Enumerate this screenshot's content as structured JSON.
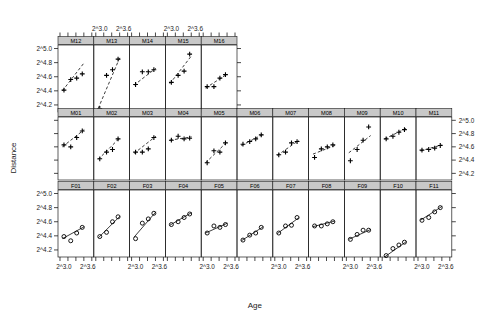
{
  "figure": {
    "xlabel": "Age",
    "ylabel": "Distance",
    "y_ticks": [
      "2^5.0",
      "2^4.8",
      "2^4.6",
      "2^4.4",
      "2^4.2"
    ],
    "x_ticks": [
      "2^3.0",
      "2^3.6"
    ],
    "strip_fill": "#c8c8c8",
    "line_color": "#1a1a1a",
    "marker_color": "#000000"
  },
  "chart_data": {
    "type": "scatter",
    "title": "",
    "xlabel": "Age",
    "ylabel": "Distance",
    "xlim": [
      2.85,
      3.75
    ],
    "ylim": [
      4.1,
      5.05
    ],
    "xtick_values": [
      3.0,
      3.6
    ],
    "xtick_labels": [
      "2^3.0",
      "2^3.6"
    ],
    "ytick_values": [
      5.0,
      4.8,
      4.6,
      4.4,
      4.2
    ],
    "ytick_labels": [
      "2^5.0",
      "2^4.8",
      "2^4.6",
      "2^4.4",
      "2^4.2"
    ],
    "grid": false,
    "legend": "none",
    "x_values": [
      3.0,
      3.17,
      3.32,
      3.46
    ],
    "rows": [
      {
        "row": "top",
        "marker": "plus",
        "linestyle": "dashed",
        "panels": [
          {
            "label": "M12",
            "values": [
              4.41,
              4.56,
              4.58,
              4.64
            ],
            "fit": [
              4.4,
              4.8
            ]
          },
          {
            "label": "M13",
            "values": [
              4.15,
              4.62,
              4.7,
              4.85
            ],
            "fit": [
              4.15,
              4.88
            ]
          },
          {
            "label": "M14",
            "values": [
              4.49,
              4.67,
              4.67,
              4.7
            ],
            "fit": [
              4.48,
              4.72
            ]
          },
          {
            "label": "M15",
            "values": [
              4.52,
              4.62,
              4.68,
              4.92
            ],
            "fit": [
              4.5,
              4.9
            ]
          },
          {
            "label": "M16",
            "values": [
              4.46,
              4.46,
              4.58,
              4.63
            ],
            "fit": [
              4.44,
              4.64
            ]
          }
        ]
      },
      {
        "row": "middle",
        "marker": "plus",
        "linestyle": "dashed",
        "panels": [
          {
            "label": "M01",
            "values": [
              4.63,
              4.6,
              4.74,
              4.84
            ],
            "fit": [
              4.6,
              4.86
            ]
          },
          {
            "label": "M02",
            "values": [
              4.42,
              4.52,
              4.56,
              4.72
            ],
            "fit": [
              4.41,
              4.74
            ]
          },
          {
            "label": "M03",
            "values": [
              4.52,
              4.52,
              4.57,
              4.74
            ],
            "fit": [
              4.5,
              4.76
            ]
          },
          {
            "label": "M04",
            "values": [
              4.7,
              4.76,
              4.72,
              4.73
            ],
            "fit": [
              4.7,
              4.75
            ]
          },
          {
            "label": "M05",
            "values": [
              4.36,
              4.54,
              4.52,
              4.66
            ],
            "fit": [
              4.36,
              4.68
            ]
          },
          {
            "label": "M06",
            "values": [
              4.64,
              4.68,
              4.72,
              4.78
            ],
            "fit": [
              4.62,
              4.79
            ]
          },
          {
            "label": "M07",
            "values": [
              4.48,
              4.52,
              4.66,
              4.68
            ],
            "fit": [
              4.47,
              4.7
            ]
          },
          {
            "label": "M08",
            "values": [
              4.44,
              4.57,
              4.6,
              4.63
            ],
            "fit": [
              4.49,
              4.62
            ]
          },
          {
            "label": "M09",
            "values": [
              4.39,
              4.56,
              4.7,
              4.9
            ],
            "fit": [
              4.51,
              4.77
            ]
          },
          {
            "label": "M10",
            "values": [
              4.72,
              4.76,
              4.82,
              4.86
            ],
            "fit": [
              4.72,
              4.88
            ]
          },
          {
            "label": "M11",
            "values": [
              4.55,
              4.56,
              4.58,
              4.62
            ],
            "fit": [
              4.54,
              4.63
            ]
          }
        ]
      },
      {
        "row": "bottom",
        "marker": "circle",
        "linestyle": "solid",
        "panels": [
          {
            "label": "F01",
            "values": [
              4.39,
              4.33,
              4.44,
              4.52
            ],
            "fit": [
              4.36,
              4.53
            ]
          },
          {
            "label": "F02",
            "values": [
              4.39,
              4.45,
              4.6,
              4.67
            ],
            "fit": [
              4.37,
              4.68
            ]
          },
          {
            "label": "F03",
            "values": [
              4.36,
              4.58,
              4.64,
              4.72
            ],
            "fit": [
              4.38,
              4.74
            ]
          },
          {
            "label": "F04",
            "values": [
              4.56,
              4.6,
              4.66,
              4.71
            ],
            "fit": [
              4.55,
              4.73
            ]
          },
          {
            "label": "F05",
            "values": [
              4.44,
              4.54,
              4.52,
              4.56
            ],
            "fit": [
              4.44,
              4.58
            ]
          },
          {
            "label": "F06",
            "values": [
              4.34,
              4.41,
              4.44,
              4.52
            ],
            "fit": [
              4.33,
              4.53
            ]
          },
          {
            "label": "F07",
            "values": [
              4.44,
              4.54,
              4.55,
              4.66
            ],
            "fit": [
              4.43,
              4.66
            ]
          },
          {
            "label": "F08",
            "values": [
              4.54,
              4.54,
              4.57,
              4.6
            ],
            "fit": [
              4.53,
              4.61
            ]
          },
          {
            "label": "F09",
            "values": [
              4.35,
              4.42,
              4.48,
              4.48
            ],
            "fit": [
              4.35,
              4.49
            ]
          },
          {
            "label": "F10",
            "values": [
              4.12,
              4.22,
              4.27,
              4.31
            ],
            "fit": [
              4.1,
              4.32
            ]
          },
          {
            "label": "F11",
            "values": [
              4.62,
              4.66,
              4.74,
              4.8
            ],
            "fit": [
              4.62,
              4.82
            ]
          }
        ]
      }
    ]
  }
}
